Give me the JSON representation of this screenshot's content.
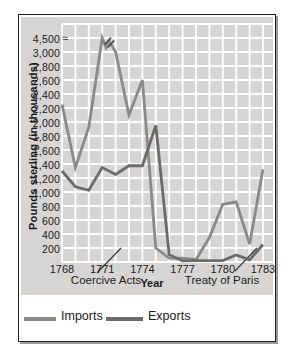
{
  "chart_data": {
    "type": "line",
    "title": "",
    "xlabel": "Year",
    "ylabel": "Pounds sterling (in thousands)",
    "x": [
      1768,
      1769,
      1770,
      1771,
      1772,
      1773,
      1774,
      1775,
      1776,
      1777,
      1778,
      1779,
      1780,
      1781,
      1782,
      1783
    ],
    "x_tick_years": [
      1768,
      1771,
      1774,
      1777,
      1780,
      1783
    ],
    "x_tick_labels": [
      "1768",
      "1771",
      "1774",
      "1777",
      "1780",
      "1783"
    ],
    "y_tick_values": [
      4500,
      3000,
      2800,
      2600,
      2400,
      2200,
      2000,
      1800,
      1600,
      1400,
      1200,
      1000,
      800,
      600,
      400,
      200
    ],
    "y_tick_labels": [
      "4,500",
      "3,000",
      "2,800",
      "2,600",
      "2,400",
      "2,200",
      "2,000",
      "1,800",
      "1,600",
      "1,400",
      "1,200",
      "1,000",
      "800",
      "600",
      "400",
      "200"
    ],
    "ylim": [
      0,
      4500
    ],
    "y_break": {
      "from": 3000,
      "to": 4500
    },
    "axis_break_marker": "≈",
    "break_marks_at_year": 1771,
    "grid": true,
    "grid_color": "#ffffff",
    "panel_color": "#d7d5d3",
    "legend_position": "bottom",
    "annotations": [
      {
        "text": "Coercive Acts",
        "near_year": 1774
      },
      {
        "text": "Treaty of Paris",
        "near_year": 1783
      }
    ],
    "series": [
      {
        "name": "Imports",
        "color": "#8a8a8a",
        "values": [
          2250,
          1350,
          1925,
          4500,
          3000,
          2100,
          2600,
          200,
          55,
          55,
          35,
          350,
          825,
          860,
          255,
          1325
        ]
      },
      {
        "name": "Exports",
        "color": "#6b6b6b",
        "values": [
          1300,
          1075,
          1025,
          1350,
          1250,
          1375,
          1375,
          1950,
          105,
          15,
          20,
          20,
          20,
          100,
          30,
          250
        ]
      }
    ]
  }
}
